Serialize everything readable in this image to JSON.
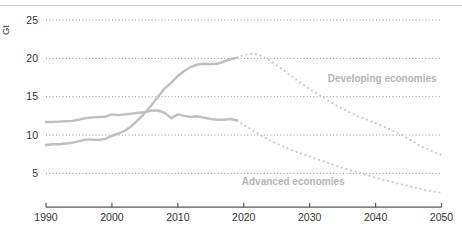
{
  "chart_data": {
    "type": "line",
    "title": "",
    "unit_label": "Gt",
    "legend": "none",
    "x_axis": {
      "range": [
        1990,
        2050
      ],
      "ticks": [
        1990,
        2000,
        2010,
        2020,
        2030,
        2040,
        2050
      ]
    },
    "y_axis": {
      "range": [
        0,
        26
      ],
      "ticks": [
        5,
        10,
        15,
        20,
        25
      ],
      "label": "Gt",
      "gridlines": "dotted"
    },
    "colors": {
      "line_solid": "#bfbfbf",
      "line_dotted": "#c8c8c8",
      "series_label": "#b5b5b5",
      "gridline": "#8f8f8f",
      "axis": "#595959",
      "tick_text": "#333333"
    },
    "series": [
      {
        "id": "advanced-historical",
        "name": "Advanced economies (historical)",
        "style": "solid",
        "color": "#bfbfbf",
        "points": [
          [
            1990,
            11.7
          ],
          [
            1991,
            11.7
          ],
          [
            1992,
            11.75
          ],
          [
            1993,
            11.8
          ],
          [
            1994,
            11.85
          ],
          [
            1995,
            12.0
          ],
          [
            1996,
            12.2
          ],
          [
            1997,
            12.3
          ],
          [
            1998,
            12.35
          ],
          [
            1999,
            12.4
          ],
          [
            2000,
            12.7
          ],
          [
            2001,
            12.6
          ],
          [
            2002,
            12.7
          ],
          [
            2003,
            12.8
          ],
          [
            2004,
            12.9
          ],
          [
            2005,
            13.0
          ],
          [
            2006,
            13.2
          ],
          [
            2007,
            13.2
          ],
          [
            2008,
            12.9
          ],
          [
            2009,
            12.2
          ],
          [
            2010,
            12.7
          ],
          [
            2011,
            12.5
          ],
          [
            2012,
            12.35
          ],
          [
            2013,
            12.45
          ],
          [
            2014,
            12.25
          ],
          [
            2015,
            12.1
          ],
          [
            2016,
            12.0
          ],
          [
            2017,
            12.0
          ],
          [
            2018,
            12.1
          ],
          [
            2019,
            11.9
          ]
        ]
      },
      {
        "id": "advanced-projection",
        "name": "Advanced economies (projection)",
        "style": "dotted",
        "color": "#c8c8c8",
        "points": [
          [
            2019,
            11.9
          ],
          [
            2020,
            11.3
          ],
          [
            2021,
            10.8
          ],
          [
            2022,
            10.3
          ],
          [
            2023,
            9.8
          ],
          [
            2024,
            9.3
          ],
          [
            2025,
            8.9
          ],
          [
            2026,
            8.5
          ],
          [
            2027,
            8.1
          ],
          [
            2028,
            7.8
          ],
          [
            2029,
            7.5
          ],
          [
            2030,
            7.2
          ],
          [
            2031,
            6.9
          ],
          [
            2032,
            6.6
          ],
          [
            2033,
            6.3
          ],
          [
            2034,
            6.0
          ],
          [
            2035,
            5.7
          ],
          [
            2036,
            5.45
          ],
          [
            2037,
            5.2
          ],
          [
            2038,
            4.95
          ],
          [
            2039,
            4.7
          ],
          [
            2040,
            4.45
          ],
          [
            2041,
            4.2
          ],
          [
            2042,
            4.0
          ],
          [
            2043,
            3.75
          ],
          [
            2044,
            3.55
          ],
          [
            2045,
            3.35
          ],
          [
            2046,
            3.15
          ],
          [
            2047,
            2.95
          ],
          [
            2048,
            2.75
          ],
          [
            2049,
            2.6
          ],
          [
            2050,
            2.45
          ]
        ]
      },
      {
        "id": "developing-historical",
        "name": "Developing economies (historical)",
        "style": "solid",
        "color": "#bfbfbf",
        "points": [
          [
            1990,
            8.7
          ],
          [
            1991,
            8.8
          ],
          [
            1992,
            8.8
          ],
          [
            1993,
            8.9
          ],
          [
            1994,
            9.0
          ],
          [
            1995,
            9.2
          ],
          [
            1996,
            9.4
          ],
          [
            1997,
            9.4
          ],
          [
            1998,
            9.35
          ],
          [
            1999,
            9.5
          ],
          [
            2000,
            9.9
          ],
          [
            2001,
            10.2
          ],
          [
            2002,
            10.6
          ],
          [
            2003,
            11.2
          ],
          [
            2004,
            12.0
          ],
          [
            2005,
            12.9
          ],
          [
            2006,
            13.9
          ],
          [
            2007,
            15.0
          ],
          [
            2008,
            16.1
          ],
          [
            2009,
            16.8
          ],
          [
            2010,
            17.7
          ],
          [
            2011,
            18.4
          ],
          [
            2012,
            18.9
          ],
          [
            2013,
            19.2
          ],
          [
            2014,
            19.3
          ],
          [
            2015,
            19.25
          ],
          [
            2016,
            19.3
          ],
          [
            2017,
            19.6
          ],
          [
            2018,
            19.9
          ],
          [
            2019,
            20.1
          ]
        ]
      },
      {
        "id": "developing-projection",
        "name": "Developing economies (projection)",
        "style": "dotted",
        "color": "#c8c8c8",
        "points": [
          [
            2019,
            20.1
          ],
          [
            2020,
            20.45
          ],
          [
            2021,
            20.6
          ],
          [
            2022,
            20.55
          ],
          [
            2023,
            20.2
          ],
          [
            2024,
            19.7
          ],
          [
            2025,
            19.1
          ],
          [
            2026,
            18.5
          ],
          [
            2027,
            17.85
          ],
          [
            2028,
            17.2
          ],
          [
            2029,
            16.6
          ],
          [
            2030,
            16.0
          ],
          [
            2031,
            15.45
          ],
          [
            2032,
            14.9
          ],
          [
            2033,
            14.4
          ],
          [
            2034,
            13.9
          ],
          [
            2035,
            13.45
          ],
          [
            2036,
            13.0
          ],
          [
            2037,
            12.6
          ],
          [
            2038,
            12.25
          ],
          [
            2039,
            11.9
          ],
          [
            2040,
            11.55
          ],
          [
            2041,
            11.2
          ],
          [
            2042,
            10.8
          ],
          [
            2043,
            10.4
          ],
          [
            2044,
            10.0
          ],
          [
            2045,
            9.5
          ],
          [
            2046,
            9.0
          ],
          [
            2047,
            8.5
          ],
          [
            2048,
            8.1
          ],
          [
            2049,
            7.7
          ],
          [
            2050,
            7.4
          ]
        ]
      }
    ],
    "annotations": [
      {
        "id": "developing-economies",
        "text": "Developing economies",
        "x": 2041,
        "y": 17.4,
        "color": "#b5b5b5"
      },
      {
        "id": "advanced-economies",
        "text": "Advanced economies",
        "x": 2027.5,
        "y": 4.0,
        "color": "#b5b5b5"
      }
    ]
  }
}
